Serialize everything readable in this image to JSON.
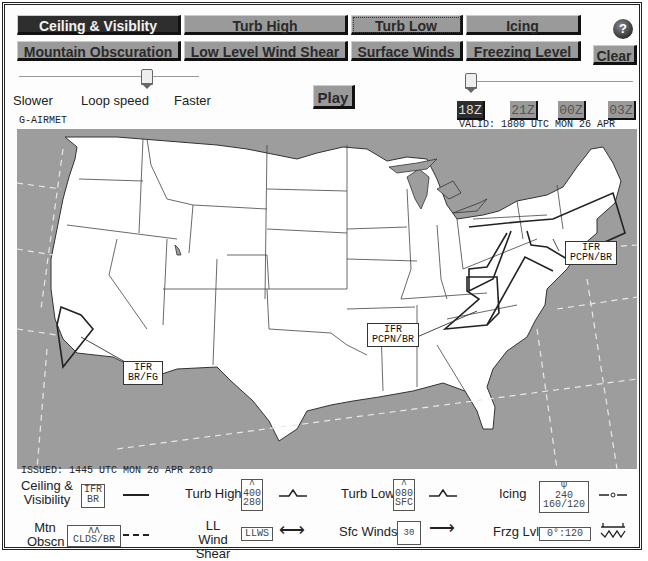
{
  "toolbar": {
    "row1": [
      {
        "label": "Ceiling & Visiblity",
        "active": true
      },
      {
        "label": "Turb High",
        "active": false
      },
      {
        "label": "Turb Low",
        "active": false
      },
      {
        "label": "Icing",
        "active": false
      }
    ],
    "row2": [
      {
        "label": "Mountain Obscuration",
        "active": false
      },
      {
        "label": "Low Level Wind Shear",
        "active": false
      },
      {
        "label": "Surface Winds",
        "active": false
      },
      {
        "label": "Freezing Level",
        "active": false
      }
    ],
    "help_label": "?",
    "clear_label": "Clear"
  },
  "loop": {
    "slower_label": "Slower",
    "speed_label": "Loop speed",
    "faster_label": "Faster",
    "play_label": "Play"
  },
  "time_buttons": [
    {
      "label": "18Z",
      "active": true
    },
    {
      "label": "21Z",
      "active": false
    },
    {
      "label": "00Z",
      "active": false
    },
    {
      "label": "03Z",
      "active": false
    }
  ],
  "product_label": "G-AIRMET",
  "valid_text": "VALID: 1800 UTC MON 26 APR 2010",
  "issued_text": "ISSUED: 1445 UTC MON 26 APR 2010",
  "map": {
    "labels": [
      {
        "line1": "IFR",
        "line2": "PCPN/BR",
        "region": "northeast-offshore"
      },
      {
        "line1": "IFR",
        "line2": "PCPN/BR",
        "region": "ohio-valley"
      },
      {
        "line1": "IFR",
        "line2": "BR/FG",
        "region": "southern-california"
      }
    ],
    "colors": {
      "land": "#ffffff",
      "water": "#9d9d9d",
      "borders": "#333333"
    }
  },
  "legend": {
    "ceiling_vis": {
      "label1": "Ceiling &",
      "label2": "Visibility",
      "box1": "IFR",
      "box2": "BR"
    },
    "turb_high": {
      "label": "Turb High",
      "box1": "400",
      "box2": "280"
    },
    "turb_low": {
      "label": "Turb Low",
      "box1": "080",
      "box2": "SFC"
    },
    "icing": {
      "label": "Icing",
      "box1": "240",
      "box2": "160/120"
    },
    "mtn_obscn": {
      "label1": "Mtn",
      "label2": "Obscn",
      "box": "CLDS/BR"
    },
    "llws": {
      "label1": "LL Wind",
      "label2": "Shear",
      "box": "LLWS"
    },
    "sfc_winds": {
      "label": "Sfc  Winds",
      "box": "30"
    },
    "frzg_lvl": {
      "label": "Frzg Lvl",
      "box": "0°:120"
    }
  }
}
